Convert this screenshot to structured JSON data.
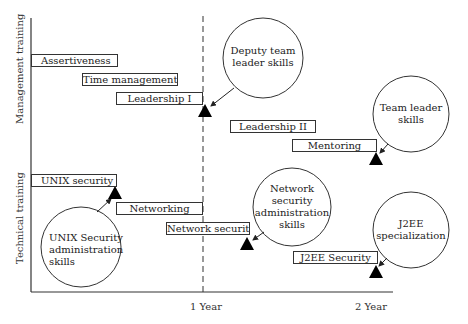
{
  "diagram": {
    "y_groups": [
      {
        "label": "Management training"
      },
      {
        "label": "Technical training"
      }
    ],
    "x_ticks": [
      {
        "label": "1 Year"
      },
      {
        "label": "2 Year"
      }
    ],
    "management_courses": [
      {
        "label": "Assertiveness"
      },
      {
        "label": "Time management"
      },
      {
        "label": "Leadership I"
      },
      {
        "label": "Leadership II"
      },
      {
        "label": "Mentoring"
      }
    ],
    "technical_courses": [
      {
        "label": "UNIX security"
      },
      {
        "label": "Networking"
      },
      {
        "label": "Network security"
      },
      {
        "label": "J2EE Security"
      }
    ],
    "milestones": [
      {
        "lines": [
          "Deputy team",
          "leader skills"
        ]
      },
      {
        "lines": [
          "Team leader",
          "skills"
        ]
      },
      {
        "lines": [
          "UNIX Security",
          "administration",
          "skills"
        ]
      },
      {
        "lines": [
          "Network",
          "security",
          "administration",
          "skills"
        ]
      },
      {
        "lines": [
          "J2EE",
          "specialization"
        ]
      }
    ],
    "colors": {
      "line": "#333333",
      "marker": "#000000",
      "background": "#ffffff"
    }
  }
}
